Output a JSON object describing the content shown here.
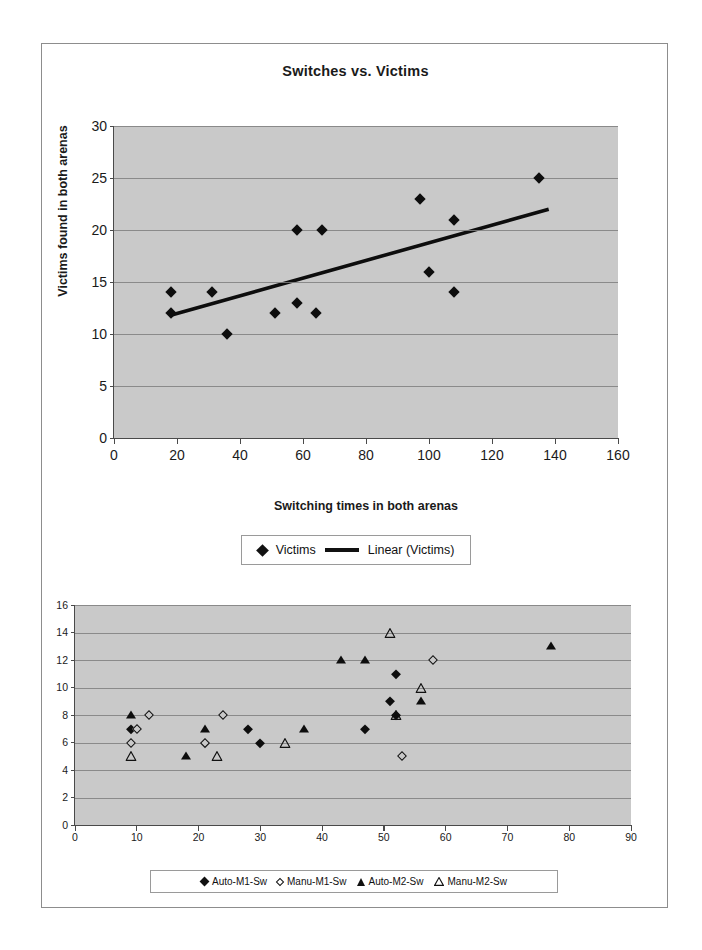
{
  "figure": {
    "background": "#ffffff",
    "frame_color": "#8d8d8d",
    "plot_background": "#c9c9c9"
  },
  "chart_data": [
    {
      "id": "switches-vs-victims",
      "type": "scatter",
      "title": "Switches vs. Victims",
      "xlabel": "Switching times in both arenas",
      "ylabel": "Victims found in both arenas",
      "xlim": [
        0,
        160
      ],
      "ylim": [
        0,
        30
      ],
      "xticks": [
        0,
        20,
        40,
        60,
        80,
        100,
        120,
        140,
        160
      ],
      "yticks": [
        0,
        5,
        10,
        15,
        20,
        25,
        30
      ],
      "grid": "horizontal",
      "legend_position": "bottom",
      "legend": [
        "Victims",
        "Linear (Victims)"
      ],
      "series": [
        {
          "name": "Victims",
          "marker": "filled-diamond",
          "color": "#0d0d0d",
          "points": [
            [
              18,
              12
            ],
            [
              18,
              14
            ],
            [
              31,
              14
            ],
            [
              36,
              10
            ],
            [
              51,
              12
            ],
            [
              58,
              20
            ],
            [
              58,
              13
            ],
            [
              64,
              12
            ],
            [
              66,
              20
            ],
            [
              97,
              23
            ],
            [
              100,
              16
            ],
            [
              108,
              21
            ],
            [
              108,
              14
            ],
            [
              135,
              25
            ]
          ]
        },
        {
          "name": "Linear (Victims)",
          "marker": "line",
          "color": "#0d0d0d",
          "trendline": {
            "x0": 18,
            "y0": 11.8,
            "x1": 138,
            "y1": 22.0
          }
        }
      ]
    },
    {
      "id": "switching-by-mode",
      "type": "scatter",
      "xlim": [
        0,
        90
      ],
      "ylim": [
        0,
        16
      ],
      "xticks": [
        0,
        10,
        20,
        30,
        40,
        50,
        60,
        70,
        80,
        90
      ],
      "yticks": [
        0,
        2,
        4,
        6,
        8,
        10,
        12,
        14,
        16
      ],
      "grid": "horizontal",
      "legend_position": "bottom",
      "legend": [
        "Auto-M1-Sw",
        "Manu-M1-Sw",
        "Auto-M2-Sw",
        "Manu-M2-Sw"
      ],
      "series": [
        {
          "name": "Auto-M1-Sw",
          "marker": "filled-diamond",
          "color": "#0d0d0d",
          "points": [
            [
              9,
              7
            ],
            [
              21,
              6
            ],
            [
              28,
              7
            ],
            [
              30,
              6
            ],
            [
              47,
              7
            ],
            [
              51,
              9
            ],
            [
              52,
              11
            ],
            [
              52,
              8
            ]
          ]
        },
        {
          "name": "Manu-M1-Sw",
          "marker": "open-diamond",
          "color": "#111111",
          "points": [
            [
              10,
              7
            ],
            [
              9,
              6
            ],
            [
              12,
              8
            ],
            [
              21,
              6
            ],
            [
              24,
              8
            ],
            [
              53,
              5
            ],
            [
              58,
              12
            ]
          ]
        },
        {
          "name": "Auto-M2-Sw",
          "marker": "filled-triangle",
          "color": "#0d0d0d",
          "points": [
            [
              9,
              8
            ],
            [
              18,
              5
            ],
            [
              21,
              7
            ],
            [
              37,
              7
            ],
            [
              43,
              12
            ],
            [
              47,
              12
            ],
            [
              56,
              9
            ],
            [
              77,
              13
            ]
          ]
        },
        {
          "name": "Manu-M2-Sw",
          "marker": "open-triangle",
          "color": "#111111",
          "points": [
            [
              9,
              5
            ],
            [
              23,
              5
            ],
            [
              34,
              6
            ],
            [
              51,
              14
            ],
            [
              52,
              8
            ],
            [
              56,
              10
            ]
          ]
        }
      ]
    }
  ]
}
